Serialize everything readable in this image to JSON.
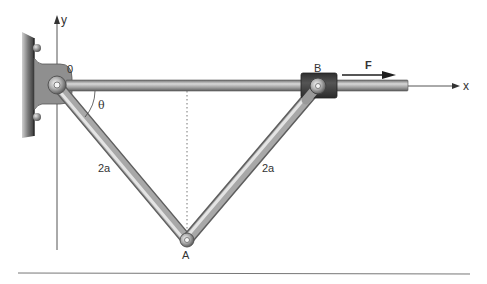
{
  "figure": {
    "type": "mechanism-diagram",
    "labels": {
      "origin": "0",
      "y_axis": "y",
      "x_axis": "x",
      "collar": "B",
      "force": "F",
      "angle": "θ",
      "left_link": "2a",
      "right_link": "2a",
      "bottom_pin": "A"
    },
    "points": {
      "O": [
        57,
        85
      ],
      "B": [
        318,
        86
      ],
      "A": [
        187,
        240
      ]
    },
    "colors": {
      "wall": "#5a5a5a",
      "bracket": "#8c8c8c",
      "rod": "#9a9a9a",
      "collar": "#3c3c3c",
      "axis": "#444444",
      "text": "#333333"
    }
  }
}
